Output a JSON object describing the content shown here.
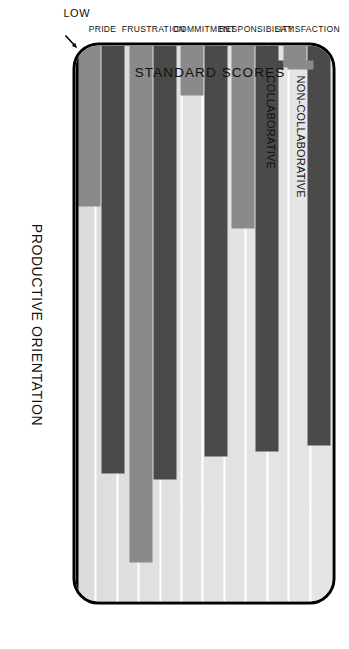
{
  "chart_data": {
    "type": "bar",
    "title": "",
    "xlabel": "PRODUCTIVE ORIENTATION",
    "ylabel": "STANDARD SCORES",
    "orientation": "vertical-grouped",
    "rotation_note": "figure printed rotated 90 degrees",
    "categories": [
      "SATISFACTION",
      "RESPONSIBILITY",
      "COMMITMENT",
      "FRUSTRATION",
      "PRIDE"
    ],
    "y_axis_ticks": [
      "LOW",
      "HIGH"
    ],
    "ylim": [
      0,
      100
    ],
    "grid": true,
    "gridline_count": 11,
    "legend_position": "upper-left-inside",
    "series": [
      {
        "name": "NON-COLLABORATIVE",
        "color": "#8a8a8a",
        "values": [
          4,
          33,
          9,
          93,
          29
        ]
      },
      {
        "name": "COLLABORATIVE",
        "color": "#4a4a4a",
        "values": [
          72,
          73,
          74,
          78,
          77
        ]
      }
    ]
  },
  "axes": {
    "x_title": "PRODUCTIVE ORIENTATION",
    "y_title": "STANDARD SCORES",
    "y_high_label": "HIGH",
    "y_low_label": "LOW"
  },
  "legend": {
    "items": [
      {
        "label": "NON-COLLABORATIVE",
        "color": "#8a8a8a"
      },
      {
        "label": "COLLABORATIVE",
        "color": "#4a4a4a"
      }
    ]
  },
  "colors": {
    "plot_background": "#e3e3e3",
    "gridline": "#ffffff",
    "frame": "#000000",
    "collaborative": "#4a4a4a",
    "non_collaborative": "#8a8a8a",
    "page_background": "#ffffff"
  }
}
